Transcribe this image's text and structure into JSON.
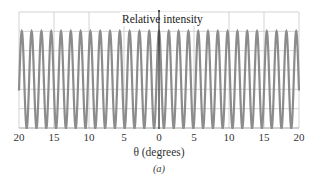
{
  "chart_data": {
    "type": "line",
    "title": "",
    "caption": "(a)",
    "xlabel": "θ (degrees)",
    "ylabel": "Relative intensity",
    "x_ticks": [
      -20,
      -15,
      -10,
      -5,
      0,
      5,
      10,
      15,
      20
    ],
    "x_tick_labels": [
      "20",
      "15",
      "10",
      "5",
      "0",
      "5",
      "10",
      "15",
      "20"
    ],
    "xlim": [
      -20,
      20
    ],
    "ylim": [
      0,
      1.2
    ],
    "grid": true,
    "function": "cos^2 double-slit interference (equal-height fringes)",
    "fringe_spacing_deg": 1.4,
    "peak_value": 1.0,
    "series": [
      {
        "name": "Relative intensity",
        "color": "#8c8c8c",
        "peaks_x": [
          -19.6,
          -18.2,
          -16.8,
          -15.4,
          -14.0,
          -12.6,
          -11.2,
          -9.8,
          -8.4,
          -7.0,
          -5.6,
          -4.2,
          -2.8,
          -1.4,
          0,
          1.4,
          2.8,
          4.2,
          5.6,
          7.0,
          8.4,
          9.8,
          11.2,
          12.6,
          14.0,
          15.4,
          16.8,
          18.2,
          19.6
        ],
        "peak_y": 1.0,
        "min_y": 0.0
      }
    ]
  },
  "labels": {
    "ylabel": "Relative intensity",
    "xlabel": "θ (degrees)",
    "caption": "(a)",
    "ticks": [
      "20",
      "15",
      "10",
      "5",
      "0",
      "5",
      "10",
      "15",
      "20"
    ]
  },
  "colors": {
    "curve": "#8c8c8c",
    "grid": "#c8c8c8",
    "axis": "#111111"
  }
}
